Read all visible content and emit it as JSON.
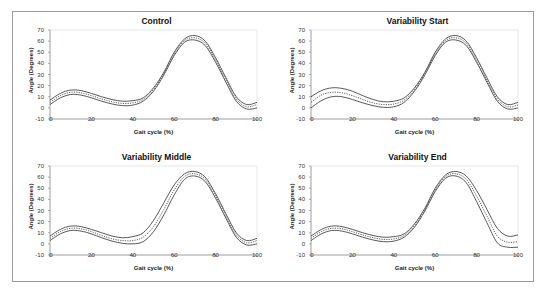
{
  "chart_data": [
    {
      "type": "line",
      "title": "Control",
      "xlabel": "Gait cycle (%)",
      "ylabel": "Angle (Degrees)",
      "xlim": [
        0,
        100
      ],
      "ylim": [
        -10,
        70
      ],
      "xticks": [
        0,
        20,
        40,
        60,
        80,
        100
      ],
      "yticks": [
        -10,
        0,
        10,
        20,
        30,
        40,
        50,
        60,
        70
      ],
      "grid": false,
      "x": [
        0,
        5,
        10,
        15,
        20,
        25,
        30,
        35,
        40,
        45,
        50,
        55,
        60,
        65,
        70,
        75,
        80,
        85,
        90,
        95,
        100
      ],
      "series": [
        {
          "name": "Upper",
          "style": "solid",
          "values": [
            7,
            13,
            16,
            15.5,
            13,
            10,
            7.5,
            6,
            6.5,
            9,
            18,
            32,
            50,
            62,
            65,
            60,
            45,
            27,
            10,
            3,
            5
          ]
        },
        {
          "name": "Mean",
          "style": "dotted",
          "values": [
            5,
            11,
            14,
            13.5,
            11,
            8,
            5.5,
            4,
            4.5,
            7.5,
            16.5,
            31,
            48.5,
            60.5,
            63,
            58,
            43,
            25,
            8,
            1,
            3
          ]
        },
        {
          "name": "Lower",
          "style": "solid",
          "values": [
            3,
            9,
            12,
            11.5,
            9,
            6,
            3.5,
            2,
            2.5,
            6,
            15,
            29.5,
            47,
            59,
            61,
            56,
            41,
            23,
            6,
            -1,
            0
          ]
        }
      ]
    },
    {
      "type": "line",
      "title": "Variability Start",
      "xlabel": "Gait cycle (%)",
      "ylabel": "Angle (Degrees)",
      "xlim": [
        0,
        100
      ],
      "ylim": [
        -10,
        70
      ],
      "xticks": [
        0,
        20,
        40,
        60,
        80,
        100
      ],
      "yticks": [
        -10,
        0,
        10,
        20,
        30,
        40,
        50,
        60,
        70
      ],
      "grid": false,
      "x": [
        0,
        5,
        10,
        15,
        20,
        25,
        30,
        35,
        40,
        45,
        50,
        55,
        60,
        65,
        70,
        75,
        80,
        85,
        90,
        95,
        100
      ],
      "series": [
        {
          "name": "Upper",
          "style": "solid",
          "values": [
            10,
            15.5,
            18,
            17.5,
            15,
            11,
            7.5,
            5.5,
            6,
            9,
            18,
            32,
            50,
            62,
            65,
            60,
            45,
            27,
            10,
            3,
            5
          ]
        },
        {
          "name": "Mean",
          "style": "dotted",
          "values": [
            5,
            11.5,
            14,
            13.5,
            11,
            7.5,
            4.5,
            3,
            3.5,
            7,
            16.5,
            31,
            48.5,
            60.5,
            63,
            58,
            43,
            25,
            8,
            1,
            2.5
          ]
        },
        {
          "name": "Lower",
          "style": "solid",
          "values": [
            0,
            6.5,
            10,
            10,
            7.5,
            4.5,
            2,
            0.5,
            1,
            5,
            15,
            29.5,
            47,
            59,
            61,
            56,
            41,
            23,
            6,
            -1,
            0
          ]
        }
      ]
    },
    {
      "type": "line",
      "title": "Variability Middle",
      "xlabel": "Gait cycle (%)",
      "ylabel": "Angle (Degrees)",
      "xlim": [
        0,
        100
      ],
      "ylim": [
        -10,
        70
      ],
      "xticks": [
        0,
        20,
        40,
        60,
        80,
        100
      ],
      "yticks": [
        -10,
        0,
        10,
        20,
        30,
        40,
        50,
        60,
        70
      ],
      "grid": false,
      "x": [
        0,
        5,
        10,
        15,
        20,
        25,
        30,
        35,
        40,
        45,
        50,
        55,
        60,
        65,
        70,
        75,
        80,
        85,
        90,
        95,
        100
      ],
      "series": [
        {
          "name": "Upper",
          "style": "solid",
          "values": [
            7,
            13,
            16,
            15.5,
            13,
            10,
            7,
            5.5,
            6.5,
            10,
            21,
            37,
            53,
            63,
            65,
            60,
            45,
            27,
            10,
            3,
            5
          ]
        },
        {
          "name": "Mean",
          "style": "dotted",
          "values": [
            5,
            11,
            14,
            13.5,
            11,
            7.5,
            4.5,
            3,
            3,
            6,
            15.5,
            31,
            48.5,
            60.5,
            63,
            58,
            43,
            25,
            8,
            1,
            3
          ]
        },
        {
          "name": "Lower",
          "style": "solid",
          "values": [
            3,
            9,
            12,
            11.5,
            9,
            5.5,
            2.5,
            0.5,
            0,
            2,
            11,
            26,
            44,
            58,
            61,
            56,
            41,
            23,
            6,
            -1,
            0
          ]
        }
      ]
    },
    {
      "type": "line",
      "title": "Variability End",
      "xlabel": "Gait cycle (%)",
      "ylabel": "Angle (Degrees)",
      "xlim": [
        0,
        100
      ],
      "ylim": [
        -10,
        70
      ],
      "xticks": [
        0,
        20,
        40,
        60,
        80,
        100
      ],
      "yticks": [
        -10,
        0,
        10,
        20,
        30,
        40,
        50,
        60,
        70
      ],
      "grid": false,
      "x": [
        0,
        5,
        10,
        15,
        20,
        25,
        30,
        35,
        40,
        45,
        50,
        55,
        60,
        65,
        70,
        75,
        80,
        85,
        90,
        95,
        100
      ],
      "series": [
        {
          "name": "Upper",
          "style": "solid",
          "values": [
            7,
            13,
            16,
            15.5,
            13,
            10,
            7.5,
            6,
            6.5,
            9,
            18,
            32,
            50,
            62,
            65,
            61,
            48,
            31,
            14,
            7,
            8
          ]
        },
        {
          "name": "Mean",
          "style": "dotted",
          "values": [
            5,
            11,
            14,
            13.5,
            11,
            8,
            5.5,
            4,
            4.5,
            7.5,
            16.5,
            31,
            48.5,
            60.5,
            63,
            58,
            43,
            25,
            7,
            1.5,
            2
          ]
        },
        {
          "name": "Lower",
          "style": "solid",
          "values": [
            3,
            9,
            12,
            11.5,
            9,
            6,
            3.5,
            2,
            2.5,
            6,
            15,
            29.5,
            47,
            59,
            61,
            55,
            38,
            19,
            1,
            -3,
            -3
          ]
        }
      ]
    }
  ]
}
